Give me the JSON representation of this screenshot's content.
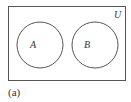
{
  "diagram": {
    "type": "venn",
    "universe_label": "U",
    "sets": [
      {
        "label": "A"
      },
      {
        "label": "B"
      }
    ],
    "relationship": "disjoint",
    "caption": "(a)",
    "stroke_color": "#555555"
  }
}
